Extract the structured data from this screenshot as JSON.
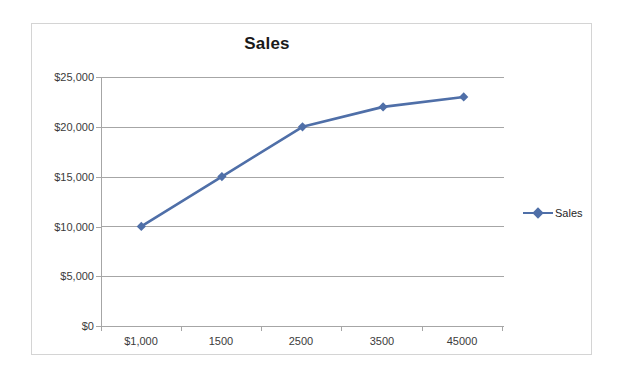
{
  "chart_data": {
    "type": "line",
    "title": "Sales",
    "xlabel": "",
    "ylabel": "",
    "categories": [
      "$1,000",
      "1500",
      "2500",
      "3500",
      "45000"
    ],
    "series": [
      {
        "name": "Sales",
        "values": [
          10000,
          15000,
          20000,
          22000,
          23000
        ],
        "color": "#4F6FA8",
        "marker": "diamond"
      }
    ],
    "ylim": [
      0,
      25000
    ],
    "y_ticks": [
      0,
      5000,
      10000,
      15000,
      20000,
      25000
    ],
    "y_tick_labels": [
      "$0",
      "$5,000",
      "$10,000",
      "$15,000",
      "$20,000",
      "$25,000"
    ],
    "grid": true,
    "legend": {
      "position": "right",
      "entries": [
        {
          "label": "Sales",
          "color": "#4F6FA8"
        }
      ]
    },
    "axis_color": "#A6A6A6",
    "plot_background": "#FFFFFF",
    "border_color": "#D4D4D4"
  }
}
